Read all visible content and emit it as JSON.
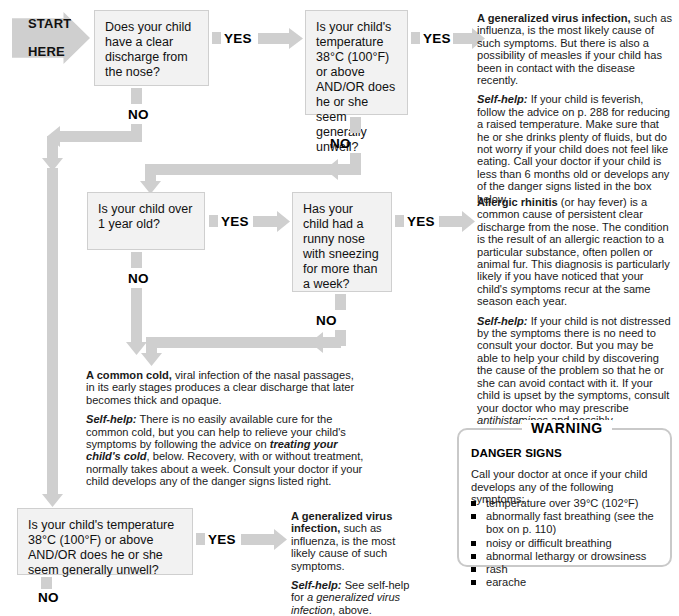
{
  "start": {
    "label_line1": "START",
    "label_line2": "HERE"
  },
  "labels": {
    "yes": "YES",
    "no": "NO"
  },
  "boxes": {
    "q1": "Does your child have a clear discharge from the nose?",
    "q2": "Is your child's temperature 38°C (100°F) or above AND/OR does he or she seem generally unwell?",
    "q3": "Is your child over 1 year old?",
    "q4": "Has your child had a runny nose with sneezing for more than a week?",
    "q5": "Is your child's temperature 38°C (100°F) or above AND/OR does he or she seem generally unwell?"
  },
  "results": {
    "virus": {
      "title": "A generalized virus infection,",
      "body": " such as influenza, is the most likely cause of such symptoms. But there is also a possibility of measles if your child has been in contact with the disease recently.",
      "selfhelp_label": "Self-help:",
      "selfhelp_body": " If your child is feverish, follow the advice on p. 288 for reducing a raised temperature. Make sure that he or she drinks plenty of fluids, but do not worry if your child does not feel like eating. Call your doctor if your child is less than 6 months old or develops any of the danger signs listed in the box below."
    },
    "rhinitis": {
      "title": "Allergic rhinitis",
      "body": " (or hay fever) is a common cause of persistent clear discharge from the nose. The condition is the result of an allergic reaction to a particular substance, often pollen or animal fur. This diagnosis is particularly likely if you have noticed that your child's symptoms recur at the same season each year.",
      "selfhelp_label": "Self-help:",
      "selfhelp_part1": " If your child is not distressed by the symptoms there is no need to consult your doctor. But you may be able to help your child by discovering the cause of the problem so that he or she can avoid contact with it. If your child is upset by the symptoms, consult your doctor who may prescribe ",
      "selfhelp_em1": "antihistamines",
      "selfhelp_part2": " and possibly ",
      "selfhelp_em2": "decongestants",
      "selfhelp_part3": " to be used in moderation."
    },
    "cold": {
      "title": "A common cold,",
      "body": " viral infection of the nasal passages, in its early stages produces a clear discharge that later becomes thick and opaque.",
      "selfhelp_label": "Self-help:",
      "selfhelp_part1": " There is no easily available cure for the common cold, but you can help to relieve your child's symptoms by following the advice on ",
      "selfhelp_em1": "treating your child's cold",
      "selfhelp_part2": ", below. Recovery, with or without treatment, normally takes about a week. Consult your doctor if your child develops any of the danger signs listed right."
    },
    "virus2": {
      "title": "A generalized virus infection,",
      "body": " such as influenza, is the most likely cause of such symptoms.",
      "selfhelp_label": "Self-help:",
      "selfhelp_part1": " See self-help for ",
      "selfhelp_em1": "a generalized virus infection",
      "selfhelp_part2": ", above."
    }
  },
  "warning": {
    "title": "WARNING",
    "heading": "DANGER SIGNS",
    "lead": "Call your doctor at once if your child develops any of the following symptoms:",
    "items": [
      "temperature over 39°C (102°F)",
      "abnormally fast breathing (see the box on p. 110)",
      "noisy or difficult breathing",
      "abnormal lethargy or drowsiness",
      "rash",
      "earache"
    ]
  },
  "colors": {
    "arrow_gray": "#cfcfcf",
    "box_fill": "#f2f2f2",
    "box_border": "#cfcfcf",
    "warn_border": "#c9c9c9"
  }
}
